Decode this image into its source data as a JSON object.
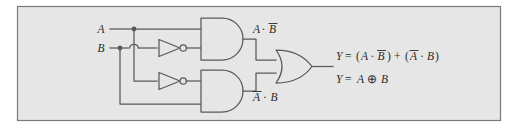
{
  "figure": {
    "kind": "logic-circuit-diagram",
    "title_text": "",
    "frame": {
      "background_color": "#e6e6e6",
      "border_color": "#7a7a7a",
      "page_color": "#ffffff"
    },
    "wire_color": "#595959",
    "gate_fill": "#e6e6e6",
    "text_color": "#2b2b2b"
  },
  "inputs": [
    {
      "id": "input-a",
      "label": "A"
    },
    {
      "id": "input-b",
      "label": "B"
    }
  ],
  "gates": [
    {
      "id": "inverter-top",
      "type": "NOT",
      "name": "not-gate-b"
    },
    {
      "id": "inverter-bottom",
      "type": "NOT",
      "name": "not-gate-a"
    },
    {
      "id": "and-top",
      "type": "AND",
      "name": "and-gate-top"
    },
    {
      "id": "and-bottom",
      "type": "AND",
      "name": "and-gate-bottom"
    },
    {
      "id": "or-gate",
      "type": "OR",
      "name": "or-gate-output"
    }
  ],
  "intermediate_labels": {
    "top_and_output": {
      "a": "A",
      "dot": "·",
      "b": "B",
      "b_overbar": true,
      "a_overbar": false
    },
    "bottom_and_output": {
      "a": "A",
      "dot": "·",
      "b": "B",
      "a_overbar": true,
      "b_overbar": false
    }
  },
  "equations": [
    {
      "id": "equation-sop",
      "parts": [
        {
          "t": "Y",
          "italic": true
        },
        {
          "t": "=",
          "italic": false
        },
        {
          "t": "(",
          "italic": false
        },
        {
          "t": "A",
          "italic": true
        },
        {
          "t": "·",
          "italic": false
        },
        {
          "t": "B",
          "italic": true,
          "overbar": true
        },
        {
          "t": ")",
          "italic": false
        },
        {
          "t": "+",
          "italic": false
        },
        {
          "t": "(",
          "italic": false
        },
        {
          "t": "A",
          "italic": true,
          "overbar": true
        },
        {
          "t": "·",
          "italic": false
        },
        {
          "t": "B",
          "italic": true
        },
        {
          "t": ")",
          "italic": false
        }
      ],
      "plain": "Y = (A · B̅) + (A̅ · B)"
    },
    {
      "id": "equation-xor",
      "parts": [
        {
          "t": "Y",
          "italic": true
        },
        {
          "t": "=",
          "italic": false
        },
        {
          "t": "A",
          "italic": true
        },
        {
          "t": "⊕",
          "italic": false
        },
        {
          "t": "B",
          "italic": true
        }
      ],
      "plain": "Y = A ⊕ B"
    }
  ]
}
